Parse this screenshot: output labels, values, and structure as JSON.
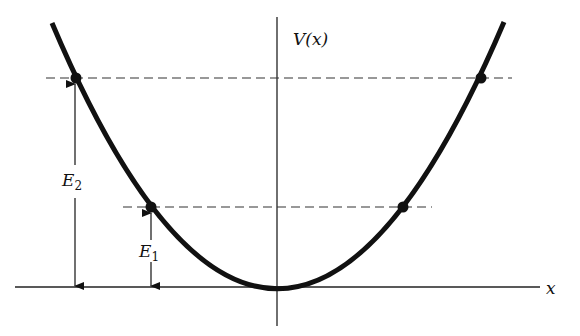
{
  "diagram": {
    "labels": {
      "y_axis": "V(x)",
      "x_axis": "x",
      "e2_main": "E",
      "e2_sub": "2",
      "e1_main": "E",
      "e1_sub": "1"
    },
    "energy_levels": [
      {
        "name": "E1",
        "y_px": 207,
        "dots_x_px": [
          151,
          403
        ]
      },
      {
        "name": "E2",
        "y_px": 78,
        "dots_x_px": [
          76,
          481
        ]
      }
    ],
    "colors": {
      "curve": "#111111",
      "axis": "#222222",
      "dashed": "#333333",
      "background": "#ffffff"
    }
  }
}
